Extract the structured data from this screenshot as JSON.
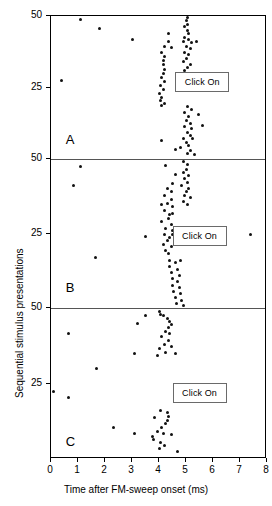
{
  "figure": {
    "type": "raster-plot",
    "panel_letters": [
      "A",
      "B",
      "C"
    ],
    "click_on_label": "Click On"
  },
  "chart_data": {
    "type": "scatter",
    "title": "",
    "subtitle": "",
    "xlabel": "Time after FM-sweep onset (ms)",
    "ylabel": "Sequential stimulus presentations",
    "xlim": [
      0,
      8
    ],
    "ylim": [
      0,
      50
    ],
    "xticks": [
      0,
      1,
      2,
      3,
      4,
      5,
      6,
      7,
      8
    ],
    "xticklabels": [
      "0",
      "1",
      "2",
      "3",
      "4",
      "5",
      "6",
      "7",
      "8"
    ],
    "yticks": [
      25,
      50
    ],
    "yticklabels": [
      "25",
      "50"
    ],
    "grid": false,
    "legend": null,
    "annotations": [
      {
        "text": "Click On",
        "panel": "A",
        "x": 5.6,
        "y": 27
      },
      {
        "text": "Click On",
        "panel": "B",
        "x": 5.5,
        "y": 24
      },
      {
        "text": "Click On",
        "panel": "C",
        "x": 5.5,
        "y": 22
      },
      {
        "text": "A",
        "panel": "A",
        "x": 0.55,
        "y": 5
      },
      {
        "text": "B",
        "panel": "B",
        "x": 0.55,
        "y": 5
      },
      {
        "text": "C",
        "panel": "C",
        "x": 0.55,
        "y": 4
      }
    ],
    "panels": [
      {
        "name": "A",
        "ylim": [
          0,
          50
        ],
        "points": [
          {
            "x": 1.1,
            "y": 48.8
          },
          {
            "x": 1.8,
            "y": 45.5
          },
          {
            "x": 3.0,
            "y": 41.8
          },
          {
            "x": 0.4,
            "y": 27.5
          },
          {
            "x": 4.35,
            "y": 44.0
          },
          {
            "x": 4.35,
            "y": 41.0
          },
          {
            "x": 4.2,
            "y": 39.4
          },
          {
            "x": 4.45,
            "y": 39.0
          },
          {
            "x": 4.1,
            "y": 37.2
          },
          {
            "x": 4.2,
            "y": 36.0
          },
          {
            "x": 4.15,
            "y": 34.6
          },
          {
            "x": 4.15,
            "y": 33.0
          },
          {
            "x": 4.2,
            "y": 31.4
          },
          {
            "x": 4.15,
            "y": 30.0
          },
          {
            "x": 4.1,
            "y": 28.6
          },
          {
            "x": 4.2,
            "y": 27.2
          },
          {
            "x": 4.05,
            "y": 25.8
          },
          {
            "x": 4.15,
            "y": 24.4
          },
          {
            "x": 4.0,
            "y": 23.0
          },
          {
            "x": 4.1,
            "y": 21.6
          },
          {
            "x": 4.05,
            "y": 20.4
          },
          {
            "x": 4.2,
            "y": 19.4
          },
          {
            "x": 4.1,
            "y": 18.6
          },
          {
            "x": 5.05,
            "y": 49.6
          },
          {
            "x": 5.0,
            "y": 48.4
          },
          {
            "x": 5.05,
            "y": 47.2
          },
          {
            "x": 4.95,
            "y": 46.2
          },
          {
            "x": 5.05,
            "y": 45.0
          },
          {
            "x": 5.1,
            "y": 43.8
          },
          {
            "x": 4.95,
            "y": 42.6
          },
          {
            "x": 5.1,
            "y": 41.8
          },
          {
            "x": 4.9,
            "y": 41.0
          },
          {
            "x": 5.2,
            "y": 40.6
          },
          {
            "x": 5.4,
            "y": 41.2
          },
          {
            "x": 5.0,
            "y": 39.4
          },
          {
            "x": 5.15,
            "y": 38.6
          },
          {
            "x": 4.95,
            "y": 37.4
          },
          {
            "x": 5.1,
            "y": 36.4
          },
          {
            "x": 5.0,
            "y": 35.2
          },
          {
            "x": 4.9,
            "y": 34.0
          },
          {
            "x": 5.15,
            "y": 33.2
          },
          {
            "x": 5.05,
            "y": 32.0
          },
          {
            "x": 4.95,
            "y": 30.8
          },
          {
            "x": 5.1,
            "y": 29.6
          },
          {
            "x": 5.0,
            "y": 28.4
          },
          {
            "x": 5.15,
            "y": 27.2
          },
          {
            "x": 5.05,
            "y": 18.4
          },
          {
            "x": 5.2,
            "y": 17.4
          },
          {
            "x": 4.95,
            "y": 16.2
          },
          {
            "x": 5.1,
            "y": 15.0
          },
          {
            "x": 5.45,
            "y": 15.6
          },
          {
            "x": 5.0,
            "y": 13.6
          },
          {
            "x": 5.15,
            "y": 12.4
          },
          {
            "x": 4.95,
            "y": 11.2
          },
          {
            "x": 5.2,
            "y": 10.8
          },
          {
            "x": 5.6,
            "y": 11.6
          },
          {
            "x": 5.05,
            "y": 9.4
          },
          {
            "x": 5.15,
            "y": 8.2
          },
          {
            "x": 4.9,
            "y": 7.2
          },
          {
            "x": 5.25,
            "y": 7.0
          },
          {
            "x": 5.0,
            "y": 5.8
          },
          {
            "x": 5.1,
            "y": 4.6
          },
          {
            "x": 4.8,
            "y": 4.0
          },
          {
            "x": 5.15,
            "y": 3.0
          },
          {
            "x": 5.05,
            "y": 2.0
          },
          {
            "x": 5.3,
            "y": 1.6
          },
          {
            "x": 4.1,
            "y": 6.6
          },
          {
            "x": 4.6,
            "y": 3.2
          }
        ]
      },
      {
        "name": "B",
        "ylim": [
          0,
          50
        ],
        "points": [
          {
            "x": 1.1,
            "y": 47.5
          },
          {
            "x": 0.85,
            "y": 41.0
          },
          {
            "x": 3.5,
            "y": 24.0
          },
          {
            "x": 1.65,
            "y": 17.0
          },
          {
            "x": 4.25,
            "y": 47.8
          },
          {
            "x": 4.6,
            "y": 44.8
          },
          {
            "x": 4.5,
            "y": 41.8
          },
          {
            "x": 4.3,
            "y": 40.2
          },
          {
            "x": 4.45,
            "y": 39.2
          },
          {
            "x": 4.2,
            "y": 37.6
          },
          {
            "x": 4.45,
            "y": 36.4
          },
          {
            "x": 4.3,
            "y": 35.0
          },
          {
            "x": 4.5,
            "y": 34.0
          },
          {
            "x": 4.2,
            "y": 32.6
          },
          {
            "x": 4.4,
            "y": 31.4
          },
          {
            "x": 4.35,
            "y": 30.0
          },
          {
            "x": 4.1,
            "y": 29.0
          },
          {
            "x": 4.45,
            "y": 28.0
          },
          {
            "x": 4.25,
            "y": 26.8
          },
          {
            "x": 4.5,
            "y": 26.0
          },
          {
            "x": 4.2,
            "y": 24.8
          },
          {
            "x": 4.4,
            "y": 23.8
          },
          {
            "x": 4.3,
            "y": 22.6
          },
          {
            "x": 4.15,
            "y": 21.4
          },
          {
            "x": 4.45,
            "y": 20.6
          },
          {
            "x": 4.25,
            "y": 19.4
          },
          {
            "x": 4.35,
            "y": 18.2
          },
          {
            "x": 4.5,
            "y": 31.8
          },
          {
            "x": 4.1,
            "y": 34.8
          },
          {
            "x": 4.9,
            "y": 49.0
          },
          {
            "x": 5.05,
            "y": 48.0
          },
          {
            "x": 5.0,
            "y": 46.6
          },
          {
            "x": 4.9,
            "y": 45.4
          },
          {
            "x": 5.1,
            "y": 44.6
          },
          {
            "x": 4.95,
            "y": 43.4
          },
          {
            "x": 5.05,
            "y": 42.2
          },
          {
            "x": 4.85,
            "y": 41.0
          },
          {
            "x": 5.1,
            "y": 40.2
          },
          {
            "x": 5.0,
            "y": 39.0
          },
          {
            "x": 4.95,
            "y": 37.8
          },
          {
            "x": 5.15,
            "y": 37.0
          },
          {
            "x": 4.9,
            "y": 35.8
          },
          {
            "x": 5.05,
            "y": 34.6
          },
          {
            "x": 4.4,
            "y": 16.0
          },
          {
            "x": 4.6,
            "y": 15.2
          },
          {
            "x": 4.8,
            "y": 15.8
          },
          {
            "x": 4.4,
            "y": 13.8
          },
          {
            "x": 4.7,
            "y": 13.0
          },
          {
            "x": 4.45,
            "y": 11.8
          },
          {
            "x": 4.75,
            "y": 11.0
          },
          {
            "x": 4.5,
            "y": 9.8
          },
          {
            "x": 4.7,
            "y": 8.8
          },
          {
            "x": 4.5,
            "y": 7.6
          },
          {
            "x": 4.75,
            "y": 6.8
          },
          {
            "x": 4.55,
            "y": 5.6
          },
          {
            "x": 4.8,
            "y": 4.8
          },
          {
            "x": 4.6,
            "y": 3.6
          },
          {
            "x": 4.85,
            "y": 2.6
          },
          {
            "x": 4.65,
            "y": 1.6
          },
          {
            "x": 4.9,
            "y": 1.0
          },
          {
            "x": 4.5,
            "y": 24.6
          },
          {
            "x": 7.4,
            "y": 24.8
          }
        ]
      },
      {
        "name": "C",
        "ylim": [
          0,
          50
        ],
        "points": [
          {
            "x": 0.65,
            "y": 41.5
          },
          {
            "x": 1.7,
            "y": 30.0
          },
          {
            "x": 0.1,
            "y": 22.5
          },
          {
            "x": 0.65,
            "y": 20.5
          },
          {
            "x": 2.3,
            "y": 10.5
          },
          {
            "x": 3.1,
            "y": 8.5
          },
          {
            "x": 3.75,
            "y": 7.5
          },
          {
            "x": 3.2,
            "y": 45.0
          },
          {
            "x": 3.5,
            "y": 47.5
          },
          {
            "x": 3.1,
            "y": 35.0
          },
          {
            "x": 4.0,
            "y": 49.0
          },
          {
            "x": 4.05,
            "y": 48.0
          },
          {
            "x": 4.15,
            "y": 47.6
          },
          {
            "x": 4.3,
            "y": 46.4
          },
          {
            "x": 4.4,
            "y": 45.6
          },
          {
            "x": 4.45,
            "y": 44.6
          },
          {
            "x": 4.35,
            "y": 43.4
          },
          {
            "x": 4.25,
            "y": 42.2
          },
          {
            "x": 4.4,
            "y": 41.4
          },
          {
            "x": 4.1,
            "y": 40.4
          },
          {
            "x": 4.35,
            "y": 39.2
          },
          {
            "x": 4.2,
            "y": 38.0
          },
          {
            "x": 4.45,
            "y": 37.2
          },
          {
            "x": 4.0,
            "y": 36.6
          },
          {
            "x": 4.25,
            "y": 35.4
          },
          {
            "x": 4.6,
            "y": 35.0
          },
          {
            "x": 3.95,
            "y": 34.4
          },
          {
            "x": 4.05,
            "y": 16.0
          },
          {
            "x": 4.3,
            "y": 15.4
          },
          {
            "x": 4.35,
            "y": 14.2
          },
          {
            "x": 3.85,
            "y": 13.6
          },
          {
            "x": 4.3,
            "y": 12.8
          },
          {
            "x": 4.25,
            "y": 11.6
          },
          {
            "x": 4.1,
            "y": 10.4
          },
          {
            "x": 3.95,
            "y": 9.2
          },
          {
            "x": 4.15,
            "y": 8.4
          },
          {
            "x": 4.45,
            "y": 8.0
          },
          {
            "x": 3.8,
            "y": 6.4
          },
          {
            "x": 4.05,
            "y": 5.6
          },
          {
            "x": 4.2,
            "y": 4.6
          },
          {
            "x": 4.0,
            "y": 3.6
          },
          {
            "x": 4.7,
            "y": 2.4
          }
        ]
      }
    ]
  }
}
